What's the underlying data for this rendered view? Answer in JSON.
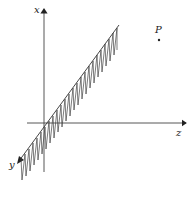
{
  "diagram": {
    "axes": {
      "x_label": "x",
      "y_label": "y",
      "z_label": "z"
    },
    "point": {
      "label": "P"
    },
    "colors": {
      "ink": "#222222",
      "background": "#ffffff"
    }
  }
}
